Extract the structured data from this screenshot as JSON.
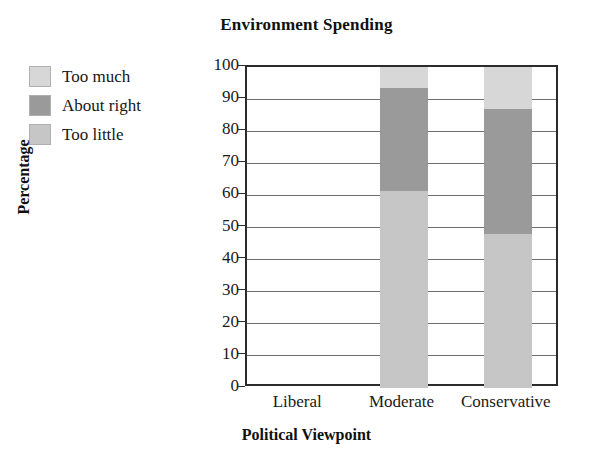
{
  "chart_data": {
    "type": "bar",
    "subtype": "stacked-bar-100",
    "title": "Environment Spending",
    "xlabel": "Political Viewpoint",
    "ylabel": "Percentage",
    "categories": [
      "Liberal",
      "Moderate",
      "Conservative"
    ],
    "series": [
      {
        "name": "Too little",
        "values": [
          0,
          61.5,
          48.0
        ],
        "color": "#c6c6c6"
      },
      {
        "name": "About right",
        "values": [
          0,
          32.0,
          39.0
        ],
        "color": "#9a9a9a"
      },
      {
        "name": "Too much",
        "values": [
          0,
          6.5,
          13.0
        ],
        "color": "#d7d7d7"
      }
    ],
    "stack_order": [
      "Too little",
      "About right",
      "Too much"
    ],
    "cumulative_tops": {
      "Liberal": [
        0,
        0,
        0
      ],
      "Moderate": [
        61.5,
        93.5,
        100
      ],
      "Conservative": [
        48.0,
        87.0,
        100
      ]
    },
    "ylim": [
      0,
      100
    ],
    "yticks": [
      0,
      10,
      20,
      30,
      40,
      50,
      60,
      70,
      80,
      90,
      100
    ],
    "ytick_labels": [
      "0",
      "10",
      "20",
      "30",
      "40",
      "50",
      "60",
      "70",
      "80",
      "90",
      "100"
    ],
    "grid": "horizontal",
    "legend_position": "upper-left-outside",
    "note_liberal": "No bar drawn for Liberal category"
  },
  "title": {
    "text": "Environment Spending"
  },
  "legend": {
    "items": [
      {
        "label": "Too much",
        "color": "#d7d7d7"
      },
      {
        "label": "About right",
        "color": "#9a9a9a"
      },
      {
        "label": "Too little",
        "color": "#c6c6c6"
      }
    ]
  },
  "axes": {
    "y": {
      "title": "Percentage",
      "ticks": [
        "100",
        "90",
        "80",
        "70",
        "60",
        "50",
        "40",
        "30",
        "20",
        "10",
        "0"
      ]
    },
    "x": {
      "title": "Political Viewpoint",
      "ticks": [
        "Liberal",
        "Moderate",
        "Conservative"
      ]
    }
  }
}
